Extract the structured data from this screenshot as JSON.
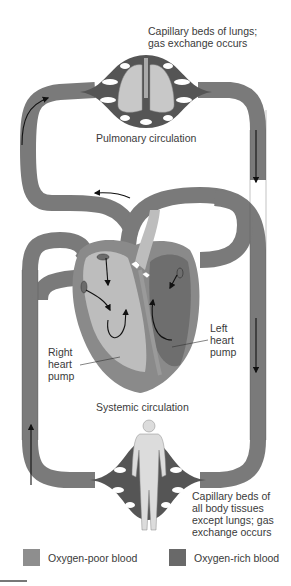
{
  "figure": {
    "labels": {
      "lung_capillaries": [
        "Capillary beds of lungs;",
        "gas exchange occurs"
      ],
      "pulmonary_circulation": "Pulmonary circulation",
      "right_heart_pump": [
        "Right",
        "heart",
        "pump"
      ],
      "left_heart_pump": [
        "Left",
        "heart",
        "pump"
      ],
      "systemic_circulation": "Systemic circulation",
      "body_capillaries": [
        "Capillary beds of",
        "all body tissues",
        "except lungs; gas",
        "exchange occurs"
      ]
    },
    "legend": [
      {
        "label": "Oxygen-poor blood",
        "color": "#8e8e8e"
      },
      {
        "label": "Oxygen-rich blood",
        "color": "#696969"
      }
    ],
    "colors": {
      "vessel": "#7a7a7a",
      "vessel_outline": "#4a4a4a",
      "oxygen_poor_chamber": "#bdbdbd",
      "oxygen_rich_chamber": "#6e6e6e",
      "heart_wall": "#8a8a8a",
      "capillary_mesh": "#555555",
      "body_figure": "#dcdcdc",
      "arrow": "#111111"
    }
  }
}
